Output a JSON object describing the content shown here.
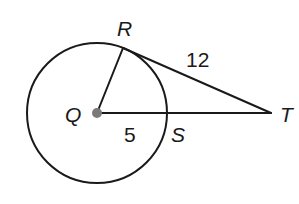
{
  "diagram": {
    "type": "circle-tangent-geometry",
    "circle": {
      "center_label": "Q",
      "cx": 97,
      "cy": 113,
      "r": 70
    },
    "points": {
      "Q": {
        "label": "Q",
        "x": 97,
        "y": 113
      },
      "R": {
        "label": "R",
        "x": 123,
        "y": 48
      },
      "S": {
        "label": "S",
        "x": 167,
        "y": 113
      },
      "T": {
        "label": "T",
        "x": 271,
        "y": 113
      }
    },
    "segments": [
      {
        "from": "Q",
        "to": "R",
        "label": ""
      },
      {
        "from": "R",
        "to": "T",
        "label": "12"
      },
      {
        "from": "Q",
        "to": "T",
        "label": ""
      }
    ],
    "measurements": {
      "RT": "12",
      "QS": "5"
    },
    "colors": {
      "stroke": "#1a1a1a",
      "center_dot": "#7a7a7a",
      "background": "#ffffff"
    }
  }
}
